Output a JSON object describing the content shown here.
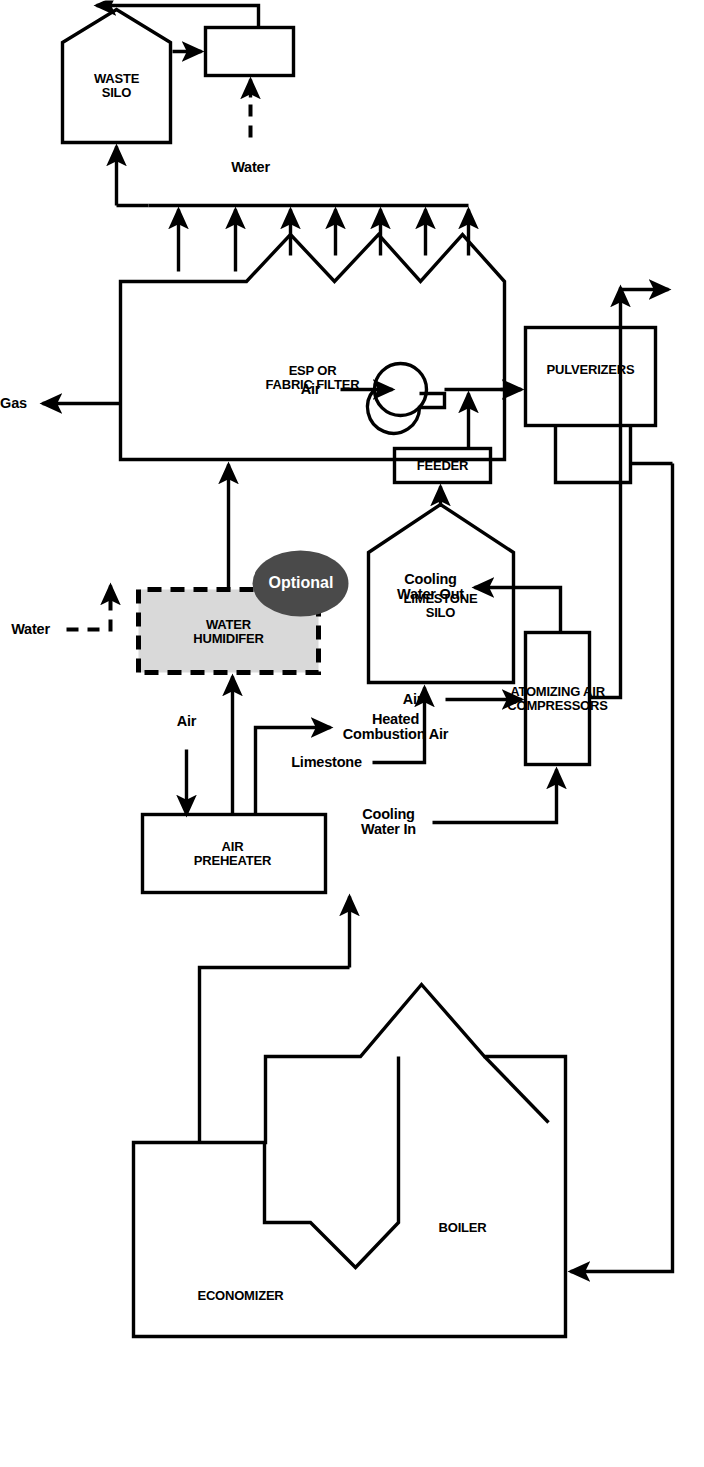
{
  "diagram": {
    "orientation": "rotated-90-ccw",
    "colors": {
      "line": "#000000",
      "background": "#ffffff",
      "optional_fill": "#4a4a4a",
      "humidifier_fill": "#d9d9d9",
      "humidifier_border": "#000000"
    },
    "units": [
      {
        "id": "boiler",
        "label": "BOILER"
      },
      {
        "id": "economizer",
        "label": "ECONOMIZER"
      },
      {
        "id": "air-preheater",
        "label": "AIR\nPREHEATER"
      },
      {
        "id": "water-humidifier",
        "label": "WATER\nHUMIDIFER",
        "optional": true,
        "optional_label": "Optional"
      },
      {
        "id": "esp-fabric-filter",
        "label": "ESP OR\nFABRIC FILTER"
      },
      {
        "id": "waste-silo",
        "label": "WASTE\nSILO"
      },
      {
        "id": "waste-mixer",
        "label": ""
      },
      {
        "id": "limestone-silo",
        "label": "LIMESTONE\nSILO"
      },
      {
        "id": "feeder",
        "label": "FEEDER"
      },
      {
        "id": "pulverizers",
        "label": "PULVERIZERS"
      },
      {
        "id": "atomizing-air-compressors",
        "label": "ATOMIZING AIR\nCOMPRESSORS"
      }
    ],
    "streams": [
      {
        "id": "treated-gas",
        "label": "Treated Gas"
      },
      {
        "id": "waste-to-disposal",
        "label": "Waste to Disposal"
      },
      {
        "id": "water-to-mixer",
        "label": "Water",
        "style": "dashed"
      },
      {
        "id": "water-to-humidifier",
        "label": "Water",
        "style": "dashed"
      },
      {
        "id": "air-to-preheater",
        "label": "Air"
      },
      {
        "id": "heated-combustion-air",
        "label": "Heated\nCombustion Air"
      },
      {
        "id": "limestone-feed",
        "label": "Limestone"
      },
      {
        "id": "air-to-blower",
        "label": "Air"
      },
      {
        "id": "cooling-water-in",
        "label": "Cooling\nWater In"
      },
      {
        "id": "air-to-compressors",
        "label": "Air"
      },
      {
        "id": "cooling-water-out",
        "label": "Cooling\nWater Out"
      }
    ]
  }
}
